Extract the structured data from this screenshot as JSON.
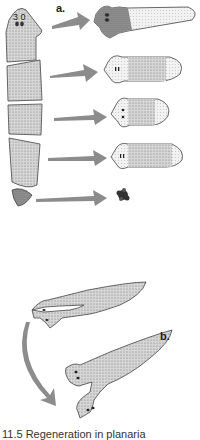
{
  "figure": {
    "panel_a_label": "a.",
    "panel_b_label": "b.",
    "head_marking": "3 0",
    "caption_partial": "11.5 Regeneration in planaria"
  },
  "colors": {
    "body_fill": "#d0d0d0",
    "body_dark": "#8a8a8a",
    "outline": "#444444",
    "arrow": "#8c8c8c"
  },
  "panel_a": {
    "segments": [
      "head",
      "pharynx-region",
      "mid-body",
      "posterior",
      "tail-tip"
    ],
    "results": [
      "regenerated-head-piece",
      "regenerated-worm-2",
      "regenerated-worm-3",
      "regenerated-worm-4",
      "disintegrated-fragment"
    ]
  },
  "panel_b": {
    "description": "split-head planarian regenerates two heads"
  }
}
